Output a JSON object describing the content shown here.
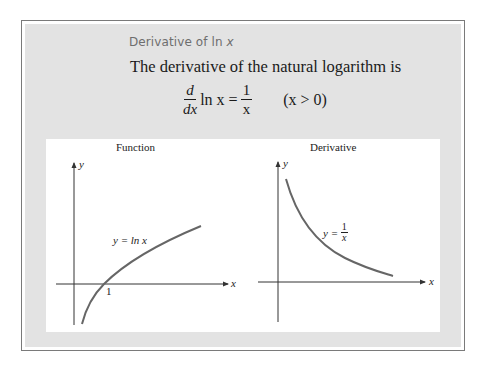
{
  "box": {
    "title_prefix": "Derivative of ln ",
    "title_var": "x",
    "statement": "The derivative of the natural logarithm is",
    "formula": {
      "d_num": "d",
      "d_den": "dx",
      "middle": "ln x =",
      "rhs_num": "1",
      "rhs_den": "x",
      "condition": "(x > 0)"
    }
  },
  "graphs": [
    {
      "title": "Function",
      "x_axis_label": "x",
      "y_axis_label": "y",
      "curve_label": "y = ln x",
      "tick_label": "1",
      "curve_color": "#666666"
    },
    {
      "title": "Derivative",
      "x_axis_label": "x",
      "y_axis_label": "y",
      "curve_label_prefix": "y =",
      "curve_label_num": "1",
      "curve_label_den": "x",
      "curve_color": "#666666"
    }
  ],
  "colors": {
    "frame_border": "#7a7a7a",
    "frame_fill": "#e3e3e3",
    "panel_fill": "#ffffff",
    "title_text": "#6e6e6e",
    "axis": "#333333",
    "curve": "#666666"
  }
}
